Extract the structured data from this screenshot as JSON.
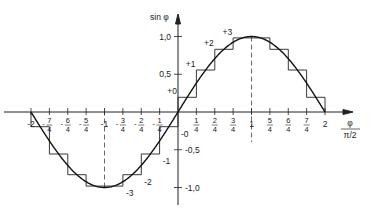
{
  "diagram": {
    "type": "sine-staircase-quantization",
    "y_axis_label": "sin φ",
    "x_axis_label": {
      "numerator": "φ",
      "denominator": "π/2"
    },
    "x_ticks": [
      {
        "value": -2,
        "label": "-2"
      },
      {
        "value": -1.75,
        "num": "7",
        "den": "4",
        "sign": "-"
      },
      {
        "value": -1.5,
        "num": "6",
        "den": "4",
        "sign": "-"
      },
      {
        "value": -1.25,
        "num": "5",
        "den": "4",
        "sign": "-"
      },
      {
        "value": -1,
        "label": "-1"
      },
      {
        "value": -0.75,
        "num": "3",
        "den": "4",
        "sign": "-"
      },
      {
        "value": -0.5,
        "num": "2",
        "den": "4",
        "sign": "-"
      },
      {
        "value": -0.25,
        "num": "1",
        "den": "4",
        "sign": "-"
      },
      {
        "value": 0.25,
        "num": "1",
        "den": "4",
        "sign": ""
      },
      {
        "value": 0.5,
        "num": "2",
        "den": "4",
        "sign": ""
      },
      {
        "value": 0.75,
        "num": "3",
        "den": "4",
        "sign": ""
      },
      {
        "value": 1,
        "label": "1"
      },
      {
        "value": 1.25,
        "num": "5",
        "den": "4",
        "sign": ""
      },
      {
        "value": 1.5,
        "num": "6",
        "den": "4",
        "sign": ""
      },
      {
        "value": 1.75,
        "num": "7",
        "den": "4",
        "sign": ""
      },
      {
        "value": 2,
        "label": "2"
      }
    ],
    "y_ticks": [
      {
        "value": 1.0,
        "label": "1,0"
      },
      {
        "value": 0.5,
        "label": "0,5"
      },
      {
        "value": -0.5,
        "label": "-0,5"
      },
      {
        "value": -1.0,
        "label": "-1,0"
      }
    ],
    "step_labels": [
      {
        "label": "+0",
        "x": 0.0,
        "y": 0.195
      },
      {
        "label": "+1",
        "x": 0.25,
        "y": 0.556
      },
      {
        "label": "+2",
        "x": 0.5,
        "y": 0.831
      },
      {
        "label": "+3",
        "x": 0.75,
        "y": 0.981
      },
      {
        "label": "-0",
        "x": 0.0,
        "y": -0.195
      },
      {
        "label": "-1",
        "x": -0.25,
        "y": -0.556
      },
      {
        "label": "-2",
        "x": -0.5,
        "y": -0.831
      },
      {
        "label": "-3",
        "x": -0.75,
        "y": -0.981
      }
    ]
  }
}
